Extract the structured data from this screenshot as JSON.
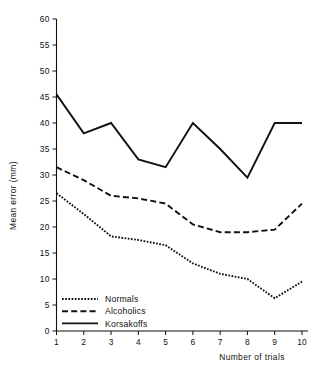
{
  "chart_data": {
    "type": "line",
    "title": "",
    "xlabel": "Number of trials",
    "ylabel": "Mean error (mm)",
    "x": [
      1,
      2,
      3,
      4,
      5,
      6,
      7,
      8,
      9,
      10
    ],
    "xtick_labels": [
      "1",
      "2",
      "3",
      "4",
      "5",
      "6",
      "7",
      "8",
      "9",
      "10"
    ],
    "ytick_labels": [
      "0",
      "5",
      "10",
      "15",
      "20",
      "25",
      "30",
      "35",
      "40",
      "45",
      "50",
      "55",
      "60"
    ],
    "yticks": [
      0,
      5,
      10,
      15,
      20,
      25,
      30,
      35,
      40,
      45,
      50,
      55,
      60
    ],
    "xlim": [
      1,
      10
    ],
    "ylim": [
      0,
      60
    ],
    "grid": false,
    "legend_position": "lower-left-inside",
    "series": [
      {
        "name": "Normals",
        "style": "dotted",
        "color": "#111111",
        "values": [
          26.5,
          22.5,
          18.2,
          17.5,
          16.5,
          13.0,
          11.0,
          10.0,
          6.3,
          9.5
        ]
      },
      {
        "name": "Alcoholics",
        "style": "dashed",
        "color": "#111111",
        "values": [
          31.5,
          29.0,
          26.0,
          25.5,
          24.5,
          20.5,
          19.0,
          19.0,
          19.5,
          24.5
        ]
      },
      {
        "name": "Korsakoffs",
        "style": "solid",
        "color": "#111111",
        "values": [
          45.5,
          38.0,
          40.0,
          33.0,
          31.5,
          40.0,
          35.0,
          29.5,
          40.0,
          40.0
        ]
      }
    ]
  },
  "legend": {
    "items": [
      {
        "label": "Normals",
        "style": "dotted"
      },
      {
        "label": "Alcoholics",
        "style": "dashed"
      },
      {
        "label": "Korsakoffs",
        "style": "solid"
      }
    ]
  },
  "axes": {
    "x_title": "Number of trials",
    "y_title": "Mean error (mm)"
  }
}
